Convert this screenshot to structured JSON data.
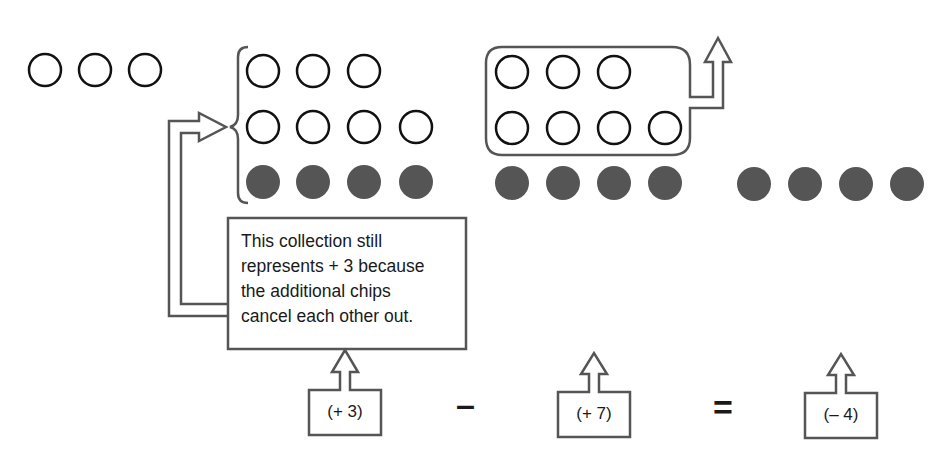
{
  "colors": {
    "outline": "#111111",
    "frame": "#555555",
    "positive_chip_fill": "#ffffff",
    "negative_chip_fill": "#555555",
    "text": "#1a1a1a"
  },
  "left_group": {
    "positive_chips": 3,
    "negative_chips": 0
  },
  "middle_group": {
    "positive_chips": 7,
    "negative_chips": 4,
    "represents": "+3"
  },
  "right_group": {
    "removed_positive_chips": 7,
    "remaining_negative_chips": 4
  },
  "result_group": {
    "negative_chips": 4
  },
  "note": {
    "lines": [
      "This collection still",
      "represents + 3 because",
      "the additional chips",
      "cancel each other out."
    ]
  },
  "equation": {
    "term1": "(+ 3)",
    "operator1": "–",
    "term2": "(+ 7)",
    "operator2": "=",
    "result": "(– 4)"
  }
}
